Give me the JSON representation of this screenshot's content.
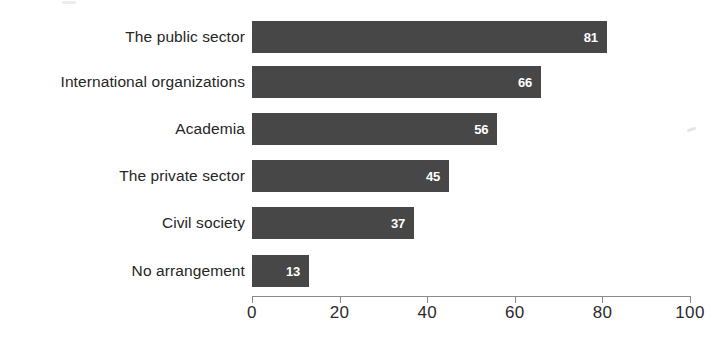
{
  "chart_data": {
    "type": "bar",
    "orientation": "horizontal",
    "title": "",
    "subtitle": "",
    "xlabel": "",
    "ylabel": "",
    "categories": [
      "The public sector",
      "International organizations",
      "Academia",
      "The private sector",
      "Civil society",
      "No arrangement"
    ],
    "values": [
      81,
      66,
      56,
      45,
      37,
      13
    ],
    "data_labels": [
      "81",
      "66",
      "56",
      "45",
      "37",
      "13"
    ],
    "xlim": [
      0,
      100
    ],
    "ylim": null,
    "x_ticks": [
      0,
      20,
      40,
      60,
      80,
      100
    ],
    "x_tick_labels": [
      "0",
      "20",
      "40",
      "60",
      "80",
      "100"
    ],
    "grid": false,
    "legend": null,
    "legend_position": "none",
    "annotations": [],
    "colors": {
      "bar": "#474747",
      "data_label": "#ffffff",
      "category_label": "#262626",
      "axis": "#8a8a8a",
      "tick_label": "#2b2b2b",
      "background": "#ffffff"
    }
  }
}
